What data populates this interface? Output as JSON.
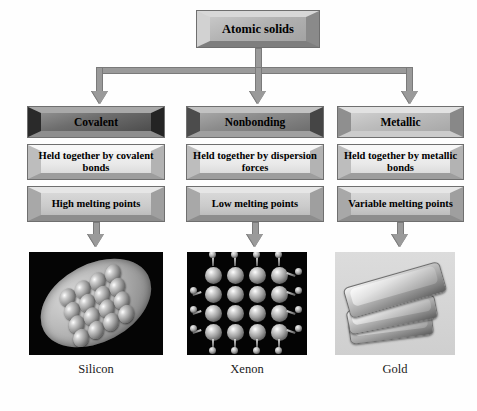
{
  "diagram": {
    "title_box": {
      "label": "Atomic solids"
    },
    "columns": [
      {
        "id": "covalent",
        "category": "Covalent",
        "bonding": "Held together by covalent bonds",
        "melting": "High melting points",
        "example_caption": "Silicon",
        "example_image": "silicon-crystal-photo"
      },
      {
        "id": "nonbonding",
        "category": "Nonbonding",
        "bonding": "Held together by dispersion forces",
        "melting": "Low melting points",
        "example_caption": "Xenon",
        "example_image": "xenon-lattice-photo"
      },
      {
        "id": "metallic",
        "category": "Metallic",
        "bonding": "Held together by metallic bonds",
        "melting": "Variable melting points",
        "example_caption": "Gold",
        "example_image": "gold-bars-photo"
      }
    ],
    "colors": {
      "background": "#fefefe",
      "connector": "#9a9a9a",
      "connector_outline": "#7a7a7a",
      "box_outline": "#6f6f6f",
      "text": "#000000",
      "caption_text": "#1a1a1a",
      "photo_dark_bg": "#050505",
      "photo_light_bg": "#d5d5d5"
    }
  }
}
